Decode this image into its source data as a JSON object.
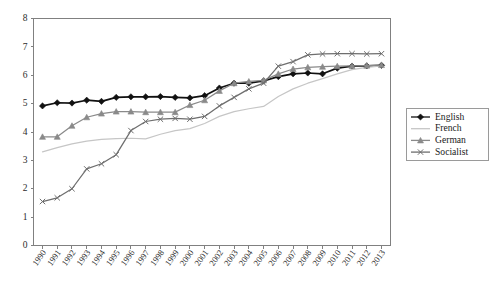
{
  "chart_data": {
    "type": "line",
    "title": "",
    "xlabel": "",
    "ylabel": "",
    "ylim": [
      0,
      8
    ],
    "ytick_step": 1,
    "grid": false,
    "legend_position": "right",
    "categories": [
      "1990",
      "1991",
      "1992",
      "1993",
      "1994",
      "1995",
      "1996",
      "1997",
      "1998",
      "1999",
      "2000",
      "2001",
      "2002",
      "2003",
      "2004",
      "2005",
      "2006",
      "2007",
      "2008",
      "2009",
      "2010",
      "2011",
      "2012",
      "2013"
    ],
    "ytick_labels": [
      "0",
      "1",
      "2",
      "3",
      "4",
      "5",
      "6",
      "7",
      "8"
    ],
    "series": [
      {
        "name": "English",
        "color": "#111111",
        "marker": "diamond",
        "values": [
          4.92,
          5.03,
          5.02,
          5.12,
          5.08,
          5.22,
          5.24,
          5.24,
          5.25,
          5.22,
          5.2,
          5.28,
          5.55,
          5.72,
          5.72,
          5.8,
          5.95,
          6.05,
          6.08,
          6.05,
          6.25,
          6.32,
          6.33,
          6.35
        ]
      },
      {
        "name": "French",
        "color": "#c6c6c6",
        "marker": "none",
        "values": [
          3.3,
          3.45,
          3.58,
          3.68,
          3.74,
          3.77,
          3.78,
          3.76,
          3.92,
          4.05,
          4.12,
          4.3,
          4.55,
          4.72,
          4.82,
          4.9,
          5.25,
          5.52,
          5.72,
          5.88,
          6.05,
          6.2,
          6.28,
          6.33
        ]
      },
      {
        "name": "German",
        "color": "#8a8a8a",
        "marker": "triangle",
        "values": [
          3.83,
          3.83,
          4.22,
          4.52,
          4.65,
          4.72,
          4.72,
          4.7,
          4.7,
          4.7,
          4.95,
          5.12,
          5.45,
          5.72,
          5.78,
          5.82,
          6.05,
          6.22,
          6.28,
          6.3,
          6.32,
          6.33,
          6.34,
          6.36
        ]
      },
      {
        "name": "Socialist",
        "color": "#6e6e6e",
        "marker": "cross",
        "values": [
          1.55,
          1.68,
          2.0,
          2.7,
          2.88,
          3.2,
          4.05,
          4.37,
          4.45,
          4.48,
          4.45,
          4.55,
          4.92,
          5.22,
          5.52,
          5.72,
          6.32,
          6.48,
          6.72,
          6.75,
          6.76,
          6.76,
          6.75,
          6.76
        ]
      }
    ]
  },
  "legend": {
    "items": [
      {
        "label": "English"
      },
      {
        "label": "French"
      },
      {
        "label": "German"
      },
      {
        "label": "Socialist"
      }
    ]
  }
}
